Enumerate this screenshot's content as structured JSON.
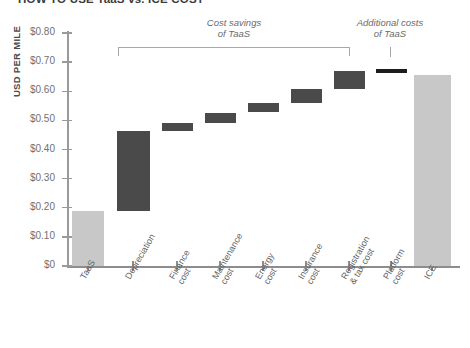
{
  "chart_title": "HOW TO USE TaaS vs. ICE COST",
  "yaxis_title": "USD PER MILE",
  "annotations": {
    "left": "Cost savings\nof TaaS",
    "right": "Additional costs\nof TaaS"
  },
  "ylabels": [
    "$0.80",
    "$0.70",
    "$0.60",
    "$0.50",
    "$0.40",
    "$0.30",
    "$0.20",
    "$0.10",
    "$0"
  ],
  "colors": {
    "light_bar": "#c8c8c8",
    "dark_bar": "#4a4a4a",
    "darkest_bar": "#1c1c1c",
    "axis": "#9a9a9a",
    "text": "#5f5f5f"
  },
  "chart_data": {
    "type": "bar",
    "subtype": "waterfall",
    "title": "HOW TO USE TaaS vs. ICE COST",
    "xlabel": "",
    "ylabel": "USD PER MILE",
    "ylim": [
      0,
      0.8
    ],
    "ytick_values": [
      0.8,
      0.7,
      0.6,
      0.5,
      0.4,
      0.3,
      0.2,
      0.1,
      0
    ],
    "ytick_labels": [
      "$0.80",
      "$0.70",
      "$0.60",
      "$0.50",
      "$0.40",
      "$0.30",
      "$0.20",
      "$0.10",
      "$0"
    ],
    "grid": false,
    "legend": "none",
    "categories": [
      "TaaS",
      "Depreciation",
      "Finance cost",
      "Maintenance cost",
      "Energy cost",
      "Insurance cost",
      "Registration & tax cost",
      "Platform cost",
      "ICE"
    ],
    "bars": [
      {
        "label": "TaaS",
        "base": 0.0,
        "top": 0.19,
        "value": 0.19,
        "kind": "total",
        "color": "#c8c8c8"
      },
      {
        "label": "Depreciation",
        "base": 0.19,
        "top": 0.465,
        "value": 0.275,
        "kind": "increase",
        "color": "#4a4a4a"
      },
      {
        "label": "Finance cost",
        "base": 0.465,
        "top": 0.492,
        "value": 0.027,
        "kind": "increase",
        "color": "#4a4a4a"
      },
      {
        "label": "Maintenance cost",
        "base": 0.492,
        "top": 0.527,
        "value": 0.035,
        "kind": "increase",
        "color": "#4a4a4a"
      },
      {
        "label": "Energy cost",
        "base": 0.527,
        "top": 0.558,
        "value": 0.031,
        "kind": "increase",
        "color": "#4a4a4a"
      },
      {
        "label": "Insurance cost",
        "base": 0.558,
        "top": 0.607,
        "value": 0.049,
        "kind": "increase",
        "color": "#4a4a4a"
      },
      {
        "label": "Registration & tax cost",
        "base": 0.607,
        "top": 0.668,
        "value": 0.061,
        "kind": "increase",
        "color": "#4a4a4a"
      },
      {
        "label": "Platform cost",
        "base": 0.662,
        "top": 0.677,
        "value": 0.015,
        "kind": "increase",
        "color": "#1c1c1c"
      },
      {
        "label": "ICE",
        "base": 0.0,
        "top": 0.655,
        "value": 0.655,
        "kind": "total",
        "color": "#c8c8c8"
      }
    ],
    "annotations": [
      {
        "text": "Cost savings of TaaS",
        "spans": [
          "Depreciation",
          "Registration & tax cost"
        ]
      },
      {
        "text": "Additional costs of TaaS",
        "spans": [
          "Platform cost"
        ]
      }
    ]
  }
}
